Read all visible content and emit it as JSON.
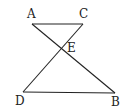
{
  "diagram": {
    "points": {
      "A": {
        "label": "A",
        "x": 32,
        "y": 24,
        "lx": 27,
        "ly": 18
      },
      "C": {
        "label": "C",
        "x": 83,
        "y": 24,
        "lx": 79,
        "ly": 18
      },
      "E": {
        "label": "E",
        "x": 61,
        "y": 49,
        "lx": 67,
        "ly": 52
      },
      "D": {
        "label": "D",
        "x": 23,
        "y": 92,
        "lx": 15,
        "ly": 105
      },
      "B": {
        "label": "B",
        "x": 115,
        "y": 93,
        "lx": 111,
        "ly": 106
      }
    },
    "segments": [
      [
        "A",
        "C"
      ],
      [
        "A",
        "B"
      ],
      [
        "C",
        "D"
      ],
      [
        "D",
        "B"
      ]
    ],
    "stroke_color": "#222222"
  }
}
